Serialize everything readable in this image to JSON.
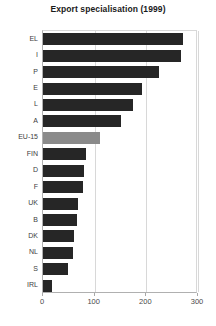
{
  "chart_data": {
    "type": "bar",
    "orientation": "horizontal",
    "title": "Export specialisation (1999)",
    "xlabel": "",
    "ylabel": "",
    "categories": [
      "EL",
      "I",
      "P",
      "E",
      "L",
      "A",
      "EU-15",
      "FIN",
      "D",
      "F",
      "UK",
      "B",
      "DK",
      "NL",
      "S",
      "IRL"
    ],
    "values": [
      271,
      267,
      224,
      192,
      174,
      151,
      110,
      83,
      79,
      77,
      68,
      66,
      60,
      58,
      48,
      17
    ],
    "highlight_category": "EU-15",
    "bar_color": "#262626",
    "highlight_color": "#8a8a8a",
    "xlim": [
      0,
      300
    ],
    "xticks": [
      0,
      100,
      200,
      300
    ],
    "xtick_labels": [
      "0",
      "100",
      "200",
      "300"
    ],
    "grid": true,
    "grid_axis": "x",
    "legend": null
  }
}
